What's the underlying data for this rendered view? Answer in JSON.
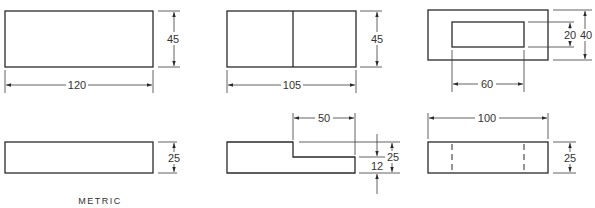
{
  "drawings": [
    {
      "id": "top-left",
      "view": "top",
      "dimensions": {
        "width": "120",
        "height": "45"
      }
    },
    {
      "id": "top-middle",
      "view": "top",
      "dimensions": {
        "width": "105",
        "height": "45"
      }
    },
    {
      "id": "top-right",
      "view": "top",
      "dimensions": {
        "inner_width": "60",
        "inner_height": "20",
        "outer_height": "40"
      }
    },
    {
      "id": "bottom-left",
      "view": "front",
      "dimensions": {
        "height": "25"
      }
    },
    {
      "id": "bottom-middle",
      "view": "front",
      "dimensions": {
        "step_width": "50",
        "total_height": "25",
        "step_height": "12"
      }
    },
    {
      "id": "bottom-right",
      "view": "front",
      "dimensions": {
        "width": "100",
        "height": "25"
      }
    }
  ],
  "labels": {
    "units_note": "METRIC"
  }
}
